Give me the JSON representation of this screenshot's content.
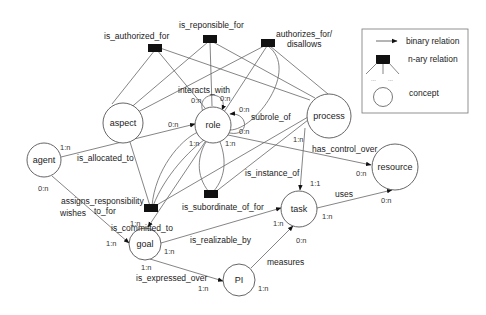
{
  "legend": {
    "binary_relation": "binary relation",
    "nary_relation": "n-ary relation",
    "concept": "concept",
    "dots": "... ..."
  },
  "concepts": {
    "aspect": "aspect",
    "role": "role",
    "process": "process",
    "agent": "agent",
    "resource": "resource",
    "task": "task",
    "goal": "goal",
    "pi": "PI"
  },
  "nary_relations": {
    "is_authorized_for": "is_authorized_for",
    "is_reponsible_for": "is_reponsible_for",
    "authorizes_line1": "authorizes_for/",
    "authorizes_line2": "disallows",
    "assigns_line1": "assigns_responsibility",
    "assigns_line2": "to_for",
    "is_subordinate_of_for": "is_subordinate_of_for"
  },
  "binary_relations": {
    "interacts_with": "interacts_with",
    "subrole_of": "subrole_of",
    "is_allocated_to": "is_allocated_to",
    "has_control_over": "has_control_over",
    "is_instance_of": "is_instance_of",
    "is_committed_to": "is_committed_to",
    "wishes": "wishes",
    "uses": "uses",
    "is_realizable_by": "is_realizable_by",
    "is_expressed_over": "is_expressed_over",
    "measures": "measures"
  },
  "cardinalities": {
    "interacts_left": "0:n",
    "interacts_right": "0:n",
    "subrole_0n": "0:n",
    "alloc_role": "0:n",
    "alloc_agent": "1:n",
    "role_1n_a": "1:n",
    "role_1n_b": "1:n",
    "role_0n": "0:n",
    "process_1n": "1:n",
    "resource_0n_a": "0:n",
    "task_1_1": "1:1",
    "resource_0n_b": "0:n",
    "task_1n_uses": "1:n",
    "task_1n_left": "1:n",
    "task_0n": "0:n",
    "agent_0n": "0:n",
    "goal_1n_top": "1:n",
    "goal_1n_left": "1:n",
    "goal_1n_right": "1:n",
    "goal_1n_bottom": "1:n",
    "pi_1n_left": "1:n",
    "pi_1n_right": "1:n"
  }
}
